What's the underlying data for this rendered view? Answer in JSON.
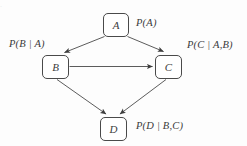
{
  "figure": {
    "type": "directed-acyclic-graph",
    "background_color": "#fdfdfd",
    "stroke_color": "#4a4a4a",
    "text_color": "#3a3a3a",
    "top_ghost_text": "."
  },
  "nodes": [
    {
      "id": "A",
      "label": "A",
      "x": 103,
      "y": 13,
      "width": 26,
      "height": 24,
      "name": "node-a"
    },
    {
      "id": "B",
      "label": "B",
      "x": 42,
      "y": 55,
      "width": 27,
      "height": 24,
      "name": "node-b"
    },
    {
      "id": "C",
      "label": "C",
      "x": 155,
      "y": 55,
      "width": 27,
      "height": 24,
      "name": "node-c"
    },
    {
      "id": "D",
      "label": "D",
      "x": 100,
      "y": 117,
      "width": 27,
      "height": 24,
      "name": "node-d"
    }
  ],
  "edges": [
    {
      "from": "A",
      "to": "B",
      "name": "edge-a-to-b"
    },
    {
      "from": "A",
      "to": "C",
      "name": "edge-a-to-c"
    },
    {
      "from": "B",
      "to": "C",
      "name": "edge-b-to-c"
    },
    {
      "from": "B",
      "to": "D",
      "name": "edge-b-to-d"
    },
    {
      "from": "C",
      "to": "D",
      "name": "edge-c-to-d"
    }
  ],
  "probability_labels": {
    "a": {
      "full": "P(A)",
      "fn": "P(",
      "target": "A",
      "bar": "",
      "given": "",
      "close": ")",
      "x": 136,
      "y": 17,
      "name": "probability-label-a"
    },
    "b": {
      "full": "P(B | A)",
      "fn": "P(",
      "target": "B",
      "bar": "|",
      "given": "A",
      "close": ")",
      "x": 9,
      "y": 38,
      "name": "probability-label-b"
    },
    "c": {
      "full": "P(C | A,B)",
      "fn": "P(",
      "target": "C",
      "bar": "|",
      "given": "A,B",
      "close": ")",
      "x": 187,
      "y": 39,
      "name": "probability-label-c"
    },
    "d": {
      "full": "P(D | B,C)",
      "fn": "P(",
      "target": "D",
      "bar": "|",
      "given": "B,C",
      "close": ")",
      "x": 136,
      "y": 120,
      "name": "probability-label-d"
    }
  }
}
